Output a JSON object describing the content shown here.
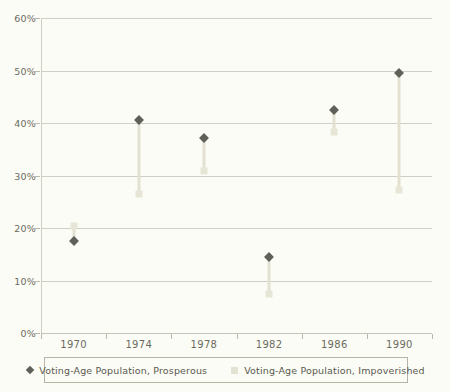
{
  "chart_data": {
    "type": "scatter",
    "title": "",
    "subtitle": "",
    "xlabel": "",
    "ylabel": "",
    "categories": [
      "1970",
      "1974",
      "1978",
      "1982",
      "1986",
      "1990"
    ],
    "x": [
      1970,
      1974,
      1978,
      1982,
      1986,
      1990
    ],
    "ylim": [
      0,
      60
    ],
    "ytick_values": [
      0,
      10,
      20,
      30,
      40,
      50,
      60
    ],
    "ytick_labels": [
      "0%",
      "10%",
      "20%",
      "30%",
      "40%",
      "50%",
      "60%"
    ],
    "grid": "horizontal",
    "legend_position": "bottom",
    "series": [
      {
        "name": "Voting-Age Population, Prosperous",
        "marker": "diamond",
        "color": "#5f6058",
        "values": [
          17.5,
          40.5,
          37.2,
          14.5,
          42.5,
          49.6
        ]
      },
      {
        "name": "Voting-Age Population, Impoverished",
        "marker": "square",
        "color": "#e6e5d6",
        "values": [
          20.4,
          26.5,
          30.8,
          7.5,
          38.3,
          27.2
        ]
      }
    ],
    "connectors": true,
    "annotations": []
  },
  "axes": {
    "y": {
      "labels": [
        "60%",
        "50%",
        "40%",
        "30%",
        "20%",
        "10%",
        "0%"
      ]
    },
    "x": {
      "labels": [
        "1970",
        "1974",
        "1978",
        "1982",
        "1986",
        "1990"
      ]
    }
  },
  "legend": {
    "entries": [
      {
        "label": "Voting-Age Population, Prosperous",
        "swatch": "diamond-marker-icon"
      },
      {
        "label": "Voting-Age Population, Impoverished",
        "swatch": "square-marker-icon"
      }
    ]
  },
  "colors": {
    "background": "#fcfcf6",
    "grid": "#cfcfc4",
    "axis": "#b9b9ac",
    "prosperous": "#5f6058",
    "impoverished": "#e6e5d6",
    "connector": "#e2e1d2",
    "text": "#6b6b60",
    "legend_border": "#b4b4a7"
  }
}
